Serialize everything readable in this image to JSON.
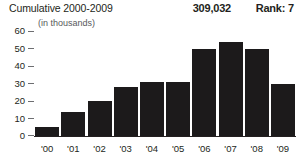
{
  "header": {
    "title": "Cumulative 2000-2009",
    "value": "309,032",
    "rank": "Rank: 7",
    "subtitle": "(in thousands)"
  },
  "colors": {
    "bar": "#1c1a1b",
    "text": "#231f20",
    "subtitle_text": "#58595b",
    "tick": "#6d6e71",
    "background": "#ffffff"
  },
  "chart_data": {
    "type": "bar",
    "title": "Cumulative 2000-2009",
    "subtitle": "(in thousands)",
    "xlabel": "",
    "ylabel": "",
    "categories": [
      "'00",
      "'01",
      "'02",
      "'03",
      "'04",
      "'05",
      "'06",
      "'07",
      "'08",
      "'09"
    ],
    "values": [
      5,
      14,
      20,
      28,
      31,
      31,
      50,
      54,
      50,
      30
    ],
    "ylim": [
      0,
      62
    ],
    "yticks": [
      0,
      10,
      20,
      30,
      40,
      50,
      60
    ],
    "ytick_labels": [
      "0",
      "10",
      "20",
      "30",
      "40",
      "50",
      "60"
    ],
    "grid": false,
    "legend": "none",
    "total_label": "309,032",
    "rank_label": "Rank: 7"
  }
}
